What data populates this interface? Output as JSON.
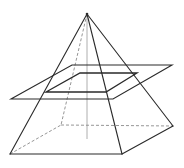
{
  "diagram": {
    "elements": {
      "apex": "apex",
      "base": [
        "front-left",
        "front-right",
        "back-right",
        "back-left"
      ],
      "visible_lateral_edges": [
        "apex-front-left",
        "apex-front-right",
        "apex-back-right"
      ],
      "hidden_lateral_edges": [
        "apex-back-left"
      ],
      "hidden_base_edges": [
        "front-left-back-left",
        "back-left-back-right"
      ],
      "height_line": true,
      "cutting_plane": "parallelogram parallel to base",
      "cross_section": "quadrilateral similar to base"
    },
    "colors": {
      "line": "#2a2a2a",
      "hidden_line": "#8a8a8a",
      "background": "#ffffff"
    }
  }
}
